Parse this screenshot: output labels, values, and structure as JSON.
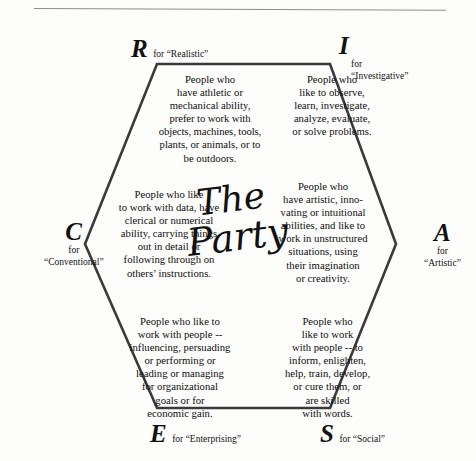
{
  "page": {
    "title": "The Party",
    "rule_color": "#8d8d8d",
    "hexagon_stroke": "#3a3a3a"
  },
  "center": {
    "line1": "The",
    "line2": "Party"
  },
  "corners": [
    {
      "letter": "R",
      "for": "for",
      "name": "“Realistic”",
      "inline_label": "for “Realistic”"
    },
    {
      "letter": "I",
      "for": "for",
      "name": "“Investigative”",
      "inline_label": "for “Investigative”"
    },
    {
      "letter": "A",
      "for": "for",
      "name": "“Artistic”",
      "inline_label": "for “Artistic”"
    },
    {
      "letter": "S",
      "for": "for",
      "name": "“Social”",
      "inline_label": "for “Social”"
    },
    {
      "letter": "E",
      "for": "for",
      "name": "“Enterprising”",
      "inline_label": "for “Enterprising”"
    },
    {
      "letter": "C",
      "for": "for",
      "name": "“Conventional”",
      "inline_label": "for “Conventional”"
    }
  ],
  "blurbs": {
    "realistic": [
      "People who",
      "have athletic or",
      "mechanical ability,",
      "prefer to work with",
      "objects, machines, tools,",
      "plants, or animals, or to",
      "be outdoors."
    ],
    "investigative": [
      "People who",
      "like to observe,",
      "learn, investigate,",
      "analyze, evaluate,",
      "or solve problems."
    ],
    "conventional": [
      "People who like",
      "to work with data, have",
      "clerical or numerical",
      "ability, carrying things",
      "out in detail or",
      "following through on",
      "others’ instructions."
    ],
    "artistic": [
      "People who",
      "have artistic, inno-",
      "vating or intuitional",
      "abilities, and like to",
      "work in unstructured",
      "situations, using",
      "their imagination",
      "or creativity."
    ],
    "enterprising": [
      "People who like to",
      "work with people --",
      "influencing, persuading",
      "or performing or",
      "leading or managing",
      "for organizational",
      "goals or for",
      "economic gain."
    ],
    "social": [
      "People who",
      "like to work",
      "with people -- to",
      "inform, enlighten,",
      "help, train, develop,",
      "or cure them, or",
      "are skilled",
      "with words."
    ]
  }
}
